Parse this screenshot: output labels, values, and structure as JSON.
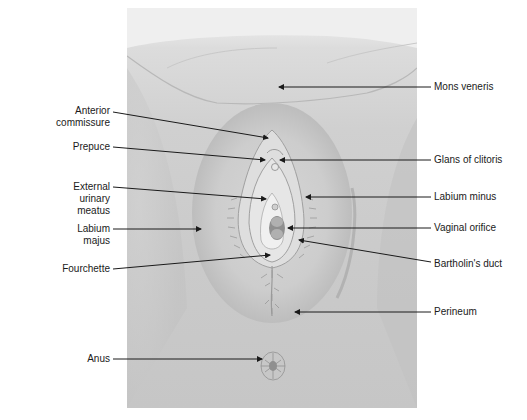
{
  "diagram": {
    "labels_left": [
      {
        "id": "anterior-commissure",
        "lines": [
          "Anterior",
          "commissure"
        ],
        "text_right": 110,
        "text_top": 105,
        "line": [
          113,
          112,
          268,
          138
        ]
      },
      {
        "id": "prepuce",
        "lines": [
          "Prepuce"
        ],
        "text_right": 110,
        "text_top": 141,
        "line": [
          113,
          147,
          265,
          160
        ]
      },
      {
        "id": "external-urinary-meatus",
        "lines": [
          "External",
          "urinary",
          "meatus"
        ],
        "text_right": 110,
        "text_top": 181,
        "line": [
          113,
          187,
          266,
          199
        ]
      },
      {
        "id": "labium-majus",
        "lines": [
          "Labium",
          "majus"
        ],
        "text_right": 110,
        "text_top": 223,
        "line": [
          113,
          229,
          201,
          229
        ]
      },
      {
        "id": "fourchette",
        "lines": [
          "Fourchette"
        ],
        "text_right": 110,
        "text_top": 263,
        "line": [
          113,
          269,
          270,
          255
        ]
      },
      {
        "id": "anus",
        "lines": [
          "Anus"
        ],
        "text_right": 110,
        "text_top": 353,
        "line": [
          113,
          359,
          262,
          359
        ]
      }
    ],
    "labels_right": [
      {
        "id": "mons-veneris",
        "lines": [
          "Mons veneris"
        ],
        "text_left": 434,
        "text_top": 81,
        "line": [
          431,
          87,
          279,
          87
        ]
      },
      {
        "id": "glans-of-clitoris",
        "lines": [
          "Glans of clitoris"
        ],
        "text_left": 434,
        "text_top": 154,
        "line": [
          431,
          160,
          280,
          160
        ]
      },
      {
        "id": "labium-minus",
        "lines": [
          "Labium minus"
        ],
        "text_left": 434,
        "text_top": 191,
        "line": [
          431,
          197,
          306,
          197
        ]
      },
      {
        "id": "vaginal-orifice",
        "lines": [
          "Vaginal orifice"
        ],
        "text_left": 434,
        "text_top": 222,
        "line": [
          431,
          228,
          288,
          228
        ]
      },
      {
        "id": "bartholins-duct",
        "lines": [
          "Bartholin's duct"
        ],
        "text_left": 434,
        "text_top": 258,
        "line": [
          431,
          262,
          299,
          240
        ]
      },
      {
        "id": "perineum",
        "lines": [
          "Perineum"
        ],
        "text_left": 434,
        "text_top": 306,
        "line": [
          431,
          312,
          295,
          312
        ]
      }
    ],
    "colors": {
      "line": "#1a1a1a",
      "panel_light": "#e6e6e6",
      "panel_dark": "#c4c4c4",
      "tissue": "#d8d8d8",
      "shadow": "#9a9a9a"
    }
  }
}
